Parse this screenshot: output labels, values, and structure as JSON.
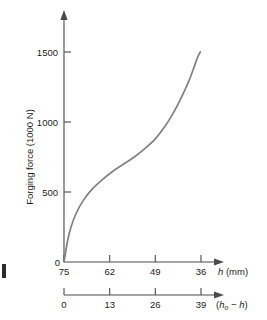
{
  "chart_data": {
    "type": "line",
    "title": "",
    "xlabel": "h (mm)",
    "xlabel_secondary": "(h₀ − h)",
    "ylabel": "Forging force (1000 N)",
    "ylim": [
      0,
      1700
    ],
    "yticks": [
      0,
      500,
      1000,
      1500
    ],
    "ytick_labels": [
      "0",
      "500",
      "1000",
      "1500"
    ],
    "xticks_primary": [
      75,
      62,
      49,
      36
    ],
    "xtick_labels_primary": [
      "75",
      "62",
      "49",
      "36"
    ],
    "xticks_secondary": [
      0,
      13,
      26,
      39
    ],
    "xtick_labels_secondary": [
      "0",
      "13",
      "26",
      "39"
    ],
    "x_axis_direction": "decreasing",
    "grid": false,
    "legend": null,
    "series": [
      {
        "name": "Forging force",
        "color": "#808080",
        "x_h_mm": [
          75.0,
          74.6,
          74.0,
          73.0,
          71.5,
          69.5,
          67.0,
          64.0,
          61.0,
          58.0,
          55.0,
          52.0,
          49.0,
          46.5,
          44.0,
          41.5,
          39.5,
          38.0,
          37.0,
          36.2
        ],
        "x_reduction_mm": [
          0.0,
          0.4,
          1.0,
          2.0,
          3.5,
          5.5,
          8.0,
          11.0,
          14.0,
          17.0,
          20.0,
          23.0,
          26.0,
          28.5,
          31.0,
          33.5,
          35.5,
          37.0,
          38.0,
          38.8
        ],
        "values": [
          0,
          60,
          150,
          250,
          350,
          440,
          520,
          590,
          650,
          700,
          750,
          810,
          880,
          960,
          1060,
          1180,
          1290,
          1390,
          1460,
          1500
        ]
      }
    ],
    "annotations": []
  },
  "figure": {
    "edge_mark_label": ""
  }
}
